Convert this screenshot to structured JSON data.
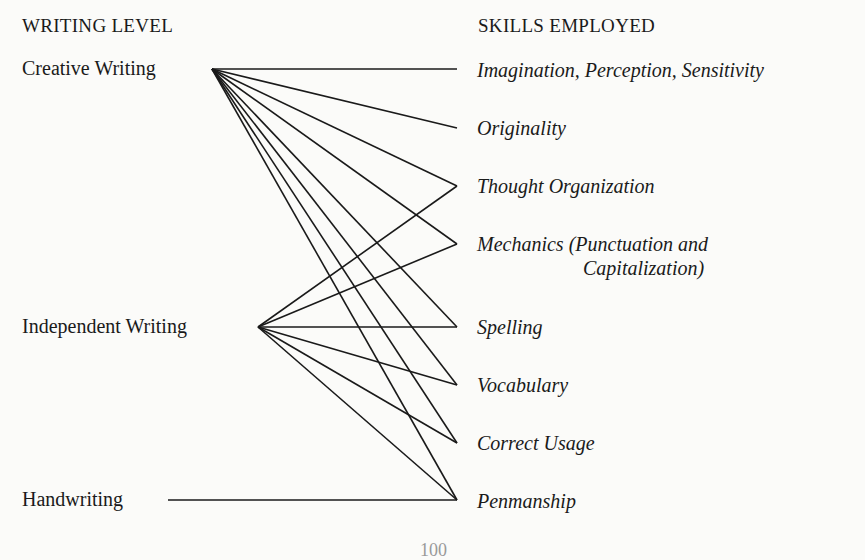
{
  "headers": {
    "left": "WRITING LEVEL",
    "right": "SKILLS EMPLOYED"
  },
  "writing_levels": [
    {
      "id": "creative",
      "label": "Creative Writing"
    },
    {
      "id": "independent",
      "label": "Independent Writing"
    },
    {
      "id": "handwriting",
      "label": "Handwriting"
    }
  ],
  "skills": [
    {
      "id": "imagination",
      "label": "Imagination, Perception, Sensitivity"
    },
    {
      "id": "originality",
      "label": "Originality"
    },
    {
      "id": "thought",
      "label": "Thought Organization"
    },
    {
      "id": "mechanics",
      "label": "Mechanics (Punctuation and",
      "label_line2": "Capitalization)"
    },
    {
      "id": "spelling",
      "label": "Spelling"
    },
    {
      "id": "vocabulary",
      "label": "Vocabulary"
    },
    {
      "id": "usage",
      "label": "Correct Usage"
    },
    {
      "id": "penmanship",
      "label": "Penmanship"
    }
  ],
  "connections": {
    "creative": [
      "imagination",
      "originality",
      "thought",
      "mechanics",
      "spelling",
      "vocabulary",
      "usage",
      "penmanship"
    ],
    "independent": [
      "thought",
      "mechanics",
      "spelling",
      "vocabulary",
      "usage",
      "penmanship"
    ],
    "handwriting": [
      "penmanship"
    ]
  },
  "page_number": "100"
}
